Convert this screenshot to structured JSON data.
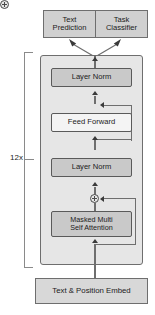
{
  "diagram": {
    "repeat_label": "12x",
    "heads": [
      {
        "id": "text-prediction",
        "label": "Text\nPrediction",
        "line1": "Text",
        "line2": "Prediction"
      },
      {
        "id": "task-classifier",
        "label": "Task\nClassifier",
        "line1": "Task",
        "line2": "Classifier"
      }
    ],
    "blocks": [
      {
        "id": "layer-norm-top",
        "label": "Layer Norm",
        "fill": "#c9c9c9"
      },
      {
        "id": "feed-forward",
        "label": "Feed Forward",
        "fill": "#f4f4f4"
      },
      {
        "id": "layer-norm-bottom",
        "label": "Layer Norm",
        "fill": "#c9c9c9"
      },
      {
        "id": "masked-attention",
        "label": "Masked Multi Self Attention",
        "line1": "Masked Multi",
        "line2": "Self Attention",
        "fill": "#c9c9c9"
      }
    ],
    "embed": {
      "id": "embed-box",
      "label": "Text & Position Embed"
    },
    "add_nodes": [
      {
        "id": "add-node-top",
        "symbol": "+"
      },
      {
        "id": "add-node-bottom",
        "symbol": "+"
      }
    ],
    "colors": {
      "block_container_fill": "#e6e6e6",
      "inner_gray_fill": "#c9c9c9",
      "inner_white_fill": "#f4f4f4",
      "head_fill": "#d0d0d0",
      "embed_fill": "#d8d8d8",
      "border": "#6e6e6e",
      "connector": "#6e6e6e",
      "arrowhead": "#3a3a3a",
      "bracket": "#8a8a8a",
      "text": "#1b1b1b",
      "background": "#ffffff"
    }
  }
}
